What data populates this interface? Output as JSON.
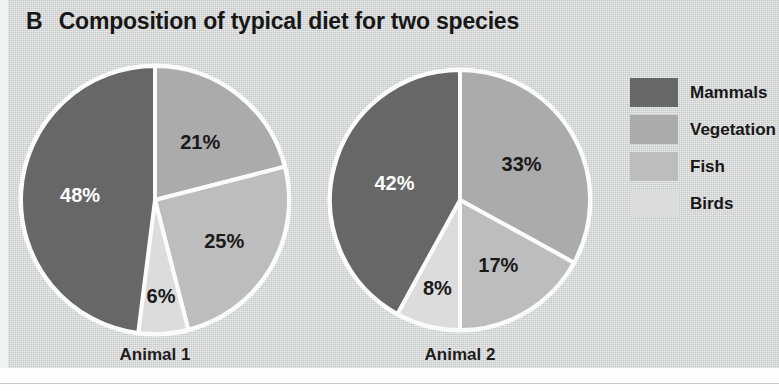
{
  "figure": {
    "panel_letter": "B",
    "title": "Composition of typical diet for two species"
  },
  "legend": {
    "items": [
      {
        "label": "Mammals",
        "color": "#676767"
      },
      {
        "label": "Vegetation",
        "color": "#ababab"
      },
      {
        "label": "Fish",
        "color": "#bdbdbd"
      },
      {
        "label": "Birds",
        "color": "#dcdcdc"
      }
    ]
  },
  "chart_data": {
    "type": "pie",
    "title": "Composition of typical diet for two species",
    "xlabel": "",
    "ylabel": "",
    "legend_position": "right",
    "grid": false,
    "value_suffix": "%",
    "categories": [
      "Mammals",
      "Vegetation",
      "Fish",
      "Birds"
    ],
    "colors": [
      "#676767",
      "#ababab",
      "#bdbdbd",
      "#dcdcdc"
    ],
    "charts": [
      {
        "name": "Animal 1",
        "caption": "Animal 1",
        "slices": [
          {
            "category": "Mammals",
            "value": 48,
            "label": "48%",
            "color": "#676767"
          },
          {
            "category": "Vegetation",
            "value": 21,
            "label": "21%",
            "color": "#ababab"
          },
          {
            "category": "Fish",
            "value": 25,
            "label": "25%",
            "color": "#bdbdbd"
          },
          {
            "category": "Birds",
            "value": 6,
            "label": "6%",
            "color": "#dcdcdc"
          }
        ]
      },
      {
        "name": "Animal 2",
        "caption": "Animal 2",
        "slices": [
          {
            "category": "Mammals",
            "value": 42,
            "label": "42%",
            "color": "#676767"
          },
          {
            "category": "Vegetation",
            "value": 33,
            "label": "33%",
            "color": "#ababab"
          },
          {
            "category": "Fish",
            "value": 17,
            "label": "17%",
            "color": "#bdbdbd"
          },
          {
            "category": "Birds",
            "value": 8,
            "label": "8%",
            "color": "#dcdcdc"
          }
        ]
      }
    ]
  },
  "render": {
    "pies": [
      {
        "cx": 155,
        "cy": 200,
        "r": 134,
        "start_angle": 0,
        "label_radii": [
          0.56,
          0.55,
          0.6,
          0.72
        ],
        "label_colors": [
          "#ffffff",
          "#1a1a1a",
          "#1a1a1a",
          "#1a1a1a"
        ],
        "caption_left": 90,
        "caption_top": 345,
        "caption_width": 130
      },
      {
        "cx": 460,
        "cy": 200,
        "r": 130,
        "start_angle": 0,
        "label_radii": [
          0.52,
          0.55,
          0.58,
          0.7
        ],
        "label_colors": [
          "#ffffff",
          "#1a1a1a",
          "#1a1a1a",
          "#1a1a1a"
        ],
        "caption_left": 395,
        "caption_top": 345,
        "caption_width": 130
      }
    ]
  }
}
